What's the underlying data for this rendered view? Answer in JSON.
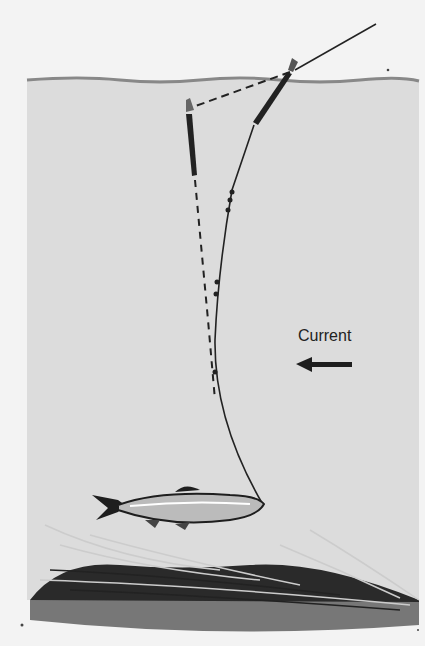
{
  "illustration": {
    "subject": "Float fishing rig drifting in current with bait fish near weed bed",
    "labels": {
      "current": "Current"
    },
    "elements": {
      "water_surface": "surface-line",
      "float_upright": "float at surface",
      "float_tilted": "float pulled under (dashed)",
      "line": "fishing line with split shot weights",
      "fish": "bait fish",
      "weeds": "weed bed on bottom",
      "arrow": "current direction arrow pointing left"
    },
    "colors": {
      "background": "#f3f3f3",
      "water": "#dcdcdc",
      "ink": "#1e1e1e"
    }
  }
}
